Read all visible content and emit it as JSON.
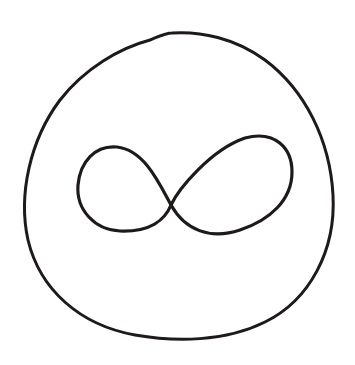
{
  "drawing": {
    "title": "",
    "background": "#ffffff",
    "stroke_color": "#1f1a1a",
    "outer_shape": {
      "kind": "rounded-circle-outline",
      "stroke_width": 3
    },
    "inner_symbol": {
      "kind": "infinity-symbol",
      "stroke_width": 3.2
    }
  }
}
